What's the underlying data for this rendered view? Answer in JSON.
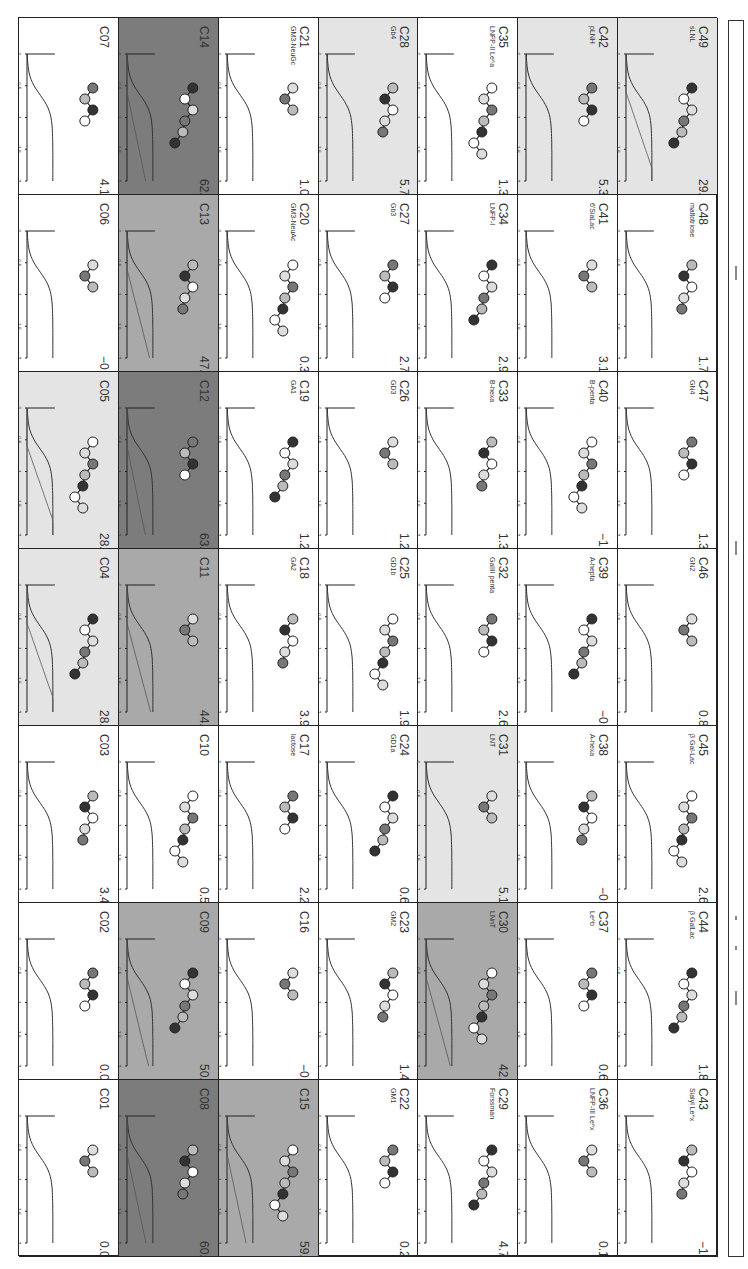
{
  "figure": {
    "orientation": "rotated-90",
    "grid": {
      "rows": 7,
      "cols": 7
    },
    "axes": {
      "x_label": "mh",
      "x_ticks": [
        "0",
        "0.5",
        "1",
        "1.5",
        "2"
      ],
      "y_label": "% of plateau",
      "y_ticks": [
        "0",
        "20",
        "40",
        "60",
        "80",
        "100"
      ]
    }
  },
  "colors": {
    "none": "#ffffff",
    "light": "#e4e4e4",
    "mid": "#a9a9a9",
    "dark": "#7c7c7c",
    "frame": "#222222"
  },
  "panels": [
    {
      "id": "C01",
      "name": "",
      "value": "0.0",
      "shade": "none",
      "col": 0,
      "row": 6
    },
    {
      "id": "C02",
      "name": "",
      "value": "0.0",
      "shade": "none",
      "col": 0,
      "row": 5
    },
    {
      "id": "C03",
      "name": "",
      "value": "3.4",
      "shade": "none",
      "col": 0,
      "row": 4
    },
    {
      "id": "C04",
      "name": "",
      "value": "28.7",
      "shade": "light",
      "col": 0,
      "row": 3
    },
    {
      "id": "C05",
      "name": "",
      "value": "28.5",
      "shade": "light",
      "col": 0,
      "row": 2
    },
    {
      "id": "C06",
      "name": "",
      "value": "-0.6",
      "shade": "none",
      "col": 0,
      "row": 1
    },
    {
      "id": "C07",
      "name": "",
      "value": "4.1",
      "shade": "none",
      "col": 0,
      "row": 0
    },
    {
      "id": "C08",
      "name": "",
      "value": "60.3",
      "shade": "dark",
      "col": 1,
      "row": 6
    },
    {
      "id": "C09",
      "name": "",
      "value": "50.7",
      "shade": "mid",
      "col": 1,
      "row": 5
    },
    {
      "id": "C10",
      "name": "",
      "value": "0.5",
      "shade": "none",
      "col": 1,
      "row": 4
    },
    {
      "id": "C11",
      "name": "",
      "value": "44.2",
      "shade": "mid",
      "col": 1,
      "row": 3
    },
    {
      "id": "C12",
      "name": "",
      "value": "63.2",
      "shade": "dark",
      "col": 1,
      "row": 2
    },
    {
      "id": "C13",
      "name": "",
      "value": "47.2",
      "shade": "mid",
      "col": 1,
      "row": 1
    },
    {
      "id": "C14",
      "name": "",
      "value": "62.0",
      "shade": "dark",
      "col": 1,
      "row": 0
    },
    {
      "id": "C15",
      "name": "",
      "value": "59.8",
      "shade": "mid",
      "col": 2,
      "row": 6
    },
    {
      "id": "C16",
      "name": "",
      "value": "-0.7",
      "shade": "none",
      "col": 2,
      "row": 5
    },
    {
      "id": "C17",
      "name": "lactose",
      "value": "2.2",
      "shade": "none",
      "col": 2,
      "row": 4
    },
    {
      "id": "C18",
      "name": "GA2",
      "value": "3.9",
      "shade": "none",
      "col": 2,
      "row": 3
    },
    {
      "id": "C19",
      "name": "GA1",
      "value": "1.2",
      "shade": "none",
      "col": 2,
      "row": 2
    },
    {
      "id": "C20",
      "name": "GM3-NeuAc",
      "value": "0.3",
      "shade": "none",
      "col": 2,
      "row": 1
    },
    {
      "id": "C21",
      "name": "GM3-NeuGc",
      "value": "1.0",
      "shade": "none",
      "col": 2,
      "row": 0
    },
    {
      "id": "C22",
      "name": "GM1",
      "value": "0.2",
      "shade": "none",
      "col": 3,
      "row": 6
    },
    {
      "id": "C23",
      "name": "GM2",
      "value": "1.4",
      "shade": "none",
      "col": 3,
      "row": 5
    },
    {
      "id": "C24",
      "name": "GD1a",
      "value": "0.6",
      "shade": "none",
      "col": 3,
      "row": 4
    },
    {
      "id": "C25",
      "name": "GD1b",
      "value": "1.9",
      "shade": "none",
      "col": 3,
      "row": 3
    },
    {
      "id": "C26",
      "name": "GD3",
      "value": "1.2",
      "shade": "none",
      "col": 3,
      "row": 2
    },
    {
      "id": "C27",
      "name": "Gb3",
      "value": "2.7",
      "shade": "none",
      "col": 3,
      "row": 1
    },
    {
      "id": "C28",
      "name": "Gb4",
      "value": "5.7",
      "shade": "light",
      "col": 3,
      "row": 0
    },
    {
      "id": "C29",
      "name": "Forssman",
      "value": "4.7",
      "shade": "none",
      "col": 4,
      "row": 6
    },
    {
      "id": "C30",
      "name": "LNnT",
      "value": "42.3",
      "shade": "mid",
      "col": 4,
      "row": 5
    },
    {
      "id": "C31",
      "name": "LNT",
      "value": "5.1",
      "shade": "light",
      "col": 4,
      "row": 4
    },
    {
      "id": "C32",
      "name": "GalIII penta",
      "value": "2.6",
      "shade": "none",
      "col": 4,
      "row": 3
    },
    {
      "id": "C33",
      "name": "B-hexa",
      "value": "1.3",
      "shade": "none",
      "col": 4,
      "row": 2
    },
    {
      "id": "C34",
      "name": "LNFP-I",
      "value": "2.9",
      "shade": "none",
      "col": 4,
      "row": 1
    },
    {
      "id": "C35",
      "name": "LNFP-II Le^a",
      "value": "1.3",
      "shade": "none",
      "col": 4,
      "row": 0
    },
    {
      "id": "C36",
      "name": "LNFP-III Le^x",
      "value": "0.1",
      "shade": "none",
      "col": 5,
      "row": 6
    },
    {
      "id": "C37",
      "name": "Le^b",
      "value": "0.6",
      "shade": "none",
      "col": 5,
      "row": 5
    },
    {
      "id": "C38",
      "name": "A-hexa",
      "value": "-0.9",
      "shade": "none",
      "col": 5,
      "row": 4
    },
    {
      "id": "C39",
      "name": "A-hepta",
      "value": "-0.2",
      "shade": "none",
      "col": 5,
      "row": 3
    },
    {
      "id": "C40",
      "name": "B-penta",
      "value": "-1.5",
      "shade": "none",
      "col": 5,
      "row": 2
    },
    {
      "id": "C41",
      "name": "6'SiaLac",
      "value": "3.1",
      "shade": "none",
      "col": 5,
      "row": 1
    },
    {
      "id": "C42",
      "name": "pLNH",
      "value": "5.3",
      "shade": "light",
      "col": 5,
      "row": 0
    },
    {
      "id": "C43",
      "name": "Sialyl Le^x",
      "value": "-1.1",
      "shade": "none",
      "col": 6,
      "row": 6
    },
    {
      "id": "C44",
      "name": "β GalLac",
      "value": "1.8",
      "shade": "none",
      "col": 6,
      "row": 5
    },
    {
      "id": "C45",
      "name": "β Gal-Lac",
      "value": "2.6",
      "shade": "none",
      "col": 6,
      "row": 4
    },
    {
      "id": "C46",
      "name": "GN2",
      "value": "0.8",
      "shade": "none",
      "col": 6,
      "row": 3
    },
    {
      "id": "C47",
      "name": "GN4",
      "value": "1.3",
      "shade": "none",
      "col": 6,
      "row": 2
    },
    {
      "id": "C48",
      "name": "maltotriose",
      "value": "1.7",
      "shade": "none",
      "col": 6,
      "row": 1
    },
    {
      "id": "C49",
      "name": "sLNL",
      "value": "29.8",
      "shade": "light",
      "col": 6,
      "row": 0
    }
  ],
  "chart_data": {
    "type": "line",
    "xlabel": "mL",
    "ylabel": "% of plateau",
    "xlim": [
      0,
      2
    ],
    "ylim": [
      0,
      100
    ],
    "x_ticks": [
      0,
      0.5,
      1,
      1.5,
      2
    ],
    "y_ticks": [
      0,
      20,
      40,
      60,
      80,
      100
    ],
    "categories": [
      "C01",
      "C02",
      "C03",
      "C04",
      "C05",
      "C06",
      "C07",
      "C08",
      "C09",
      "C10",
      "C11",
      "C12",
      "C13",
      "C14",
      "C15",
      "C16",
      "C17",
      "C18",
      "C19",
      "C20",
      "C21",
      "C22",
      "C23",
      "C24",
      "C25",
      "C26",
      "C27",
      "C28",
      "C29",
      "C30",
      "C31",
      "C32",
      "C33",
      "C34",
      "C35",
      "C36",
      "C37",
      "C38",
      "C39",
      "C40",
      "C41",
      "C42",
      "C43",
      "C44",
      "C45",
      "C46",
      "C47",
      "C48",
      "C49"
    ],
    "values": [
      0.0,
      0.0,
      3.4,
      28.7,
      28.5,
      -0.6,
      4.1,
      60.3,
      50.7,
      0.5,
      44.2,
      63.2,
      47.2,
      62.0,
      59.8,
      -0.7,
      2.2,
      3.9,
      1.2,
      0.3,
      1.0,
      0.2,
      1.4,
      0.6,
      1.9,
      1.2,
      2.7,
      5.7,
      4.7,
      42.3,
      5.1,
      2.6,
      1.3,
      2.9,
      1.3,
      0.1,
      0.6,
      -0.9,
      -0.2,
      -1.5,
      3.1,
      5.3,
      -1.1,
      1.8,
      2.6,
      0.8,
      1.3,
      1.7,
      29.8
    ],
    "grid": false,
    "legend_position": "right"
  },
  "legend": {
    "marks": 4
  }
}
